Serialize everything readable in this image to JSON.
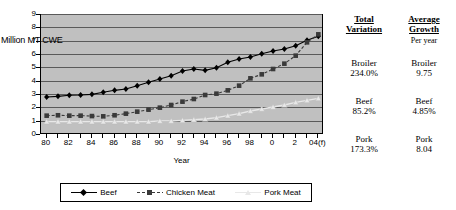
{
  "chart_data": {
    "type": "line",
    "title": "",
    "xlabel": "Year",
    "ylabel": "Million MT CWE",
    "ylim": [
      0,
      9
    ],
    "yticks": [
      0,
      1,
      2,
      3,
      4,
      5,
      6,
      7,
      8,
      9
    ],
    "grid": true,
    "legend_position": "bottom",
    "x": [
      "80",
      "81",
      "82",
      "83",
      "84",
      "85",
      "86",
      "87",
      "88",
      "89",
      "90",
      "91",
      "92",
      "93",
      "94",
      "95",
      "96",
      "97",
      "98",
      "99",
      "0",
      "1",
      "2",
      "3",
      "04(f)"
    ],
    "xtick_labels": [
      "80",
      "82",
      "84",
      "86",
      "88",
      "90",
      "92",
      "94",
      "96",
      "98",
      "0",
      "2",
      "04(f)"
    ],
    "series": [
      {
        "name": "Beef",
        "marker": "diamond",
        "color": "#000000",
        "values": [
          2.85,
          2.9,
          2.98,
          3.0,
          3.05,
          3.2,
          3.35,
          3.45,
          3.7,
          3.95,
          4.2,
          4.45,
          4.8,
          4.95,
          4.85,
          5.05,
          5.45,
          5.7,
          5.85,
          6.1,
          6.3,
          6.45,
          6.7,
          7.1,
          7.4
        ]
      },
      {
        "name": "Chicken Meat",
        "marker": "square",
        "color": "#3a3a3a",
        "values": [
          1.45,
          1.48,
          1.45,
          1.45,
          1.42,
          1.4,
          1.48,
          1.6,
          1.75,
          1.9,
          2.05,
          2.25,
          2.5,
          2.7,
          3.0,
          3.1,
          3.35,
          3.7,
          4.25,
          4.55,
          4.95,
          5.35,
          5.95,
          6.95,
          7.55
        ]
      },
      {
        "name": "Pork Meat",
        "marker": "triangle",
        "color": "#e8e8e8",
        "values": [
          1.0,
          1.0,
          1.0,
          1.0,
          1.0,
          1.0,
          1.0,
          1.0,
          1.0,
          1.0,
          1.05,
          1.05,
          1.1,
          1.15,
          1.2,
          1.3,
          1.45,
          1.6,
          1.8,
          1.95,
          2.1,
          2.25,
          2.45,
          2.6,
          2.75
        ]
      }
    ]
  },
  "axis": {
    "unit_label": "Million MT CWE",
    "x_title": "Year"
  },
  "legend": {
    "items": [
      {
        "label": "Beef"
      },
      {
        "label": "Chicken Meat"
      },
      {
        "label": "Pork Meat"
      }
    ]
  },
  "stats": {
    "header_total_line1": "Total",
    "header_total_line2": "Variation",
    "header_growth_line1": "Average",
    "header_growth_line2": "Growth",
    "header_growth_sub": "Per year",
    "rows": [
      {
        "label_total": "Broiler",
        "value_total": "234.0%",
        "label_growth": "Broiler",
        "value_growth": "9.75"
      },
      {
        "label_total": "Beef",
        "value_total": "85.2%",
        "label_growth": "Beef",
        "value_growth": "4.85%"
      },
      {
        "label_total": "Pork",
        "value_total": "173.3%",
        "label_growth": "Pork",
        "value_growth": "8.04"
      }
    ]
  }
}
